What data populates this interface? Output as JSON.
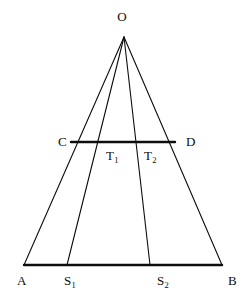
{
  "figure": {
    "type": "geometric-diagram",
    "canvas": {
      "width": 247,
      "height": 307
    },
    "style": {
      "stroke_color": "#0d0d0d",
      "background_color": "#ffffff",
      "thin_stroke_width": 1.1,
      "thick_stroke_width": 2.4
    },
    "points": {
      "O": {
        "label": "O",
        "sub": "",
        "x": 124,
        "y": 37,
        "label_x": 122,
        "label_y": 10
      },
      "A": {
        "label": "A",
        "sub": "",
        "x": 24,
        "y": 265,
        "label_x": 17,
        "label_y": 274
      },
      "B": {
        "label": "B",
        "sub": "",
        "x": 222,
        "y": 265,
        "label_x": 228,
        "label_y": 274
      },
      "C": {
        "label": "C",
        "sub": "",
        "x": 71,
        "y": 142,
        "label_x": 58,
        "label_y": 135
      },
      "D": {
        "label": "D",
        "sub": "",
        "x": 175,
        "y": 142,
        "label_x": 186,
        "label_y": 135
      },
      "S1": {
        "label": "S",
        "sub": "1",
        "x": 67,
        "y": 265,
        "label_x": 64,
        "label_y": 274
      },
      "S2": {
        "label": "S",
        "sub": "2",
        "x": 150,
        "y": 265,
        "label_x": 157,
        "label_y": 274
      },
      "T1": {
        "label": "T",
        "sub": "1",
        "x": 103,
        "y": 142,
        "label_x": 106,
        "label_y": 149
      },
      "T2": {
        "label": "T",
        "sub": "2",
        "x": 140,
        "y": 142,
        "label_x": 144,
        "label_y": 149
      }
    },
    "segments": [
      {
        "name": "segment-OA",
        "from": "O",
        "to": "A",
        "weight": "thin"
      },
      {
        "name": "segment-OB",
        "from": "O",
        "to": "B",
        "weight": "thin"
      },
      {
        "name": "segment-OS1",
        "from": "O",
        "to": "S1",
        "weight": "thin"
      },
      {
        "name": "segment-OS2",
        "from": "O",
        "to": "S2",
        "weight": "thin"
      },
      {
        "name": "segment-AB",
        "from": "A",
        "to": "B",
        "weight": "thick"
      },
      {
        "name": "segment-CD",
        "from": "C",
        "to": "D",
        "weight": "thick"
      }
    ],
    "labels": [
      "O",
      "C",
      "D",
      "T1",
      "T2",
      "A",
      "S1",
      "S2",
      "B"
    ]
  }
}
